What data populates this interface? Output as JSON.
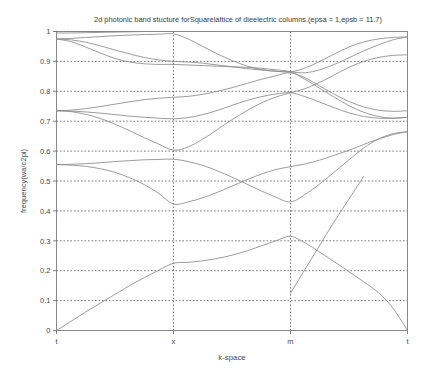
{
  "chart_data": {
    "type": "line",
    "title": "2d photonic band stucture forSquarelattice of dieelectric columns.(epsa = 1,epsb = 11.7)",
    "xlabel": "k-space",
    "ylabel": "frequency(wa/c2pi)",
    "xlim": [
      0,
      3
    ],
    "ylim": [
      0,
      1
    ],
    "grid": true,
    "legend_position": "none",
    "line_color": "#8a8a8a",
    "x_tick_positions": [
      0,
      1,
      2,
      3
    ],
    "x_tick_labels": [
      "t",
      "x",
      "m",
      "t"
    ],
    "y_tick_labels": [
      "0",
      "0.1",
      "0.2",
      "0.3",
      "0.4",
      "0.5",
      "0.6",
      "0.7",
      "0.8",
      "0.9",
      "1"
    ],
    "y_tick_values": [
      0,
      0.1,
      0.2,
      0.3,
      0.4,
      0.5,
      0.6,
      0.7,
      0.8,
      0.9,
      1.0
    ],
    "segments": [
      "t-x",
      "x-m",
      "m-t"
    ],
    "x_sampled": [
      0,
      0.125,
      0.25,
      0.375,
      0.5,
      0.625,
      0.75,
      0.875,
      1,
      1.125,
      1.25,
      1.375,
      1.5,
      1.625,
      1.75,
      1.875,
      2,
      2.125,
      2.25,
      2.375,
      2.5,
      2.625,
      2.75,
      2.875,
      3
    ],
    "series": [
      {
        "name": "band 1",
        "values": [
          0,
          0.031,
          0.062,
          0.092,
          0.121,
          0.15,
          0.177,
          0.202,
          0.225,
          0.228,
          0.233,
          0.241,
          0.252,
          0.266,
          0.283,
          0.3,
          0.315,
          0.293,
          0.262,
          0.23,
          0.197,
          0.163,
          0.127,
          0.075,
          0
        ]
      },
      {
        "name": "band 2",
        "values": [
          0.555,
          0.553,
          0.549,
          0.541,
          0.529,
          0.511,
          0.488,
          0.458,
          0.423,
          0.43,
          0.444,
          0.462,
          0.483,
          0.504,
          0.523,
          0.538,
          0.548,
          0.557,
          0.57,
          0.586,
          0.603,
          0.622,
          0.64,
          0.655,
          0.665
        ]
      },
      {
        "name": "band 3",
        "values": [
          0.555,
          0.556,
          0.558,
          0.561,
          0.565,
          0.568,
          0.571,
          0.572,
          0.573,
          0.565,
          0.552,
          0.534,
          0.513,
          0.49,
          0.467,
          0.446,
          0.43,
          0.455,
          0.49,
          0.53,
          0.571,
          0.61,
          0.64,
          0.658,
          0.665
        ]
      },
      {
        "name": "band 4",
        "values": [
          0.735,
          0.734,
          0.731,
          0.727,
          0.722,
          0.717,
          0.713,
          0.71,
          0.708,
          0.712,
          0.722,
          0.736,
          0.753,
          0.769,
          0.782,
          0.791,
          0.795,
          0.782,
          0.764,
          0.745,
          0.728,
          0.716,
          0.71,
          0.71,
          0.713
        ]
      },
      {
        "name": "band 5",
        "values": [
          0.735,
          0.732,
          0.723,
          0.709,
          0.69,
          0.668,
          0.645,
          0.623,
          0.603,
          0.614,
          0.64,
          0.672,
          0.705,
          0.735,
          0.761,
          0.781,
          0.795,
          0.809,
          0.83,
          0.855,
          0.88,
          0.9,
          0.913,
          0.92,
          0.922
        ]
      },
      {
        "name": "band 6",
        "values": [
          0.735,
          0.737,
          0.742,
          0.749,
          0.757,
          0.765,
          0.772,
          0.777,
          0.78,
          0.783,
          0.79,
          0.8,
          0.812,
          0.826,
          0.84,
          0.852,
          0.862,
          0.845,
          0.818,
          0.79,
          0.766,
          0.748,
          0.737,
          0.733,
          0.735
        ]
      },
      {
        "name": "band 7",
        "values": [
          0.975,
          0.972,
          0.964,
          0.952,
          0.938,
          0.925,
          0.913,
          0.905,
          0.9,
          0.898,
          0.894,
          0.888,
          0.882,
          0.876,
          0.871,
          0.867,
          0.865,
          0.878,
          0.9,
          0.925,
          0.948,
          0.965,
          0.975,
          0.98,
          0.982
        ]
      },
      {
        "name": "band 8",
        "values": [
          0.975,
          0.977,
          0.98,
          0.983,
          0.986,
          0.988,
          0.99,
          0.991,
          0.992,
          0.975,
          0.95,
          0.925,
          0.903,
          0.885,
          0.873,
          0.867,
          0.865,
          0.862,
          0.872,
          0.89,
          0.912,
          0.935,
          0.955,
          0.972,
          0.982
        ]
      },
      {
        "name": "band 9",
        "values": [
          0.975,
          0.966,
          0.948,
          0.928,
          0.91,
          0.898,
          0.892,
          0.89,
          0.89,
          0.888,
          0.886,
          0.884,
          0.882,
          0.88,
          0.877,
          0.872,
          0.865,
          0.84,
          0.81,
          0.78,
          0.752,
          0.73,
          0.716,
          0.71,
          0.713
        ]
      },
      {
        "name": "band 10",
        "values": [
          0.995,
          0.995,
          0.996,
          0.997,
          0.998,
          0.999,
          1.0,
          1.0,
          1.0,
          1.0,
          1.0,
          1.0,
          1.0,
          1.0,
          1.0,
          1.0,
          1.0,
          1.0,
          1.0,
          1.0,
          1.0,
          1.0,
          1.0,
          1.0,
          1.0
        ]
      },
      {
        "name": "band 11 (m-t only)",
        "x": [
          2,
          2.125,
          2.25,
          2.375,
          2.5,
          2.625
        ],
        "values": [
          0.125,
          0.205,
          0.285,
          0.365,
          0.44,
          0.515
        ]
      }
    ]
  }
}
